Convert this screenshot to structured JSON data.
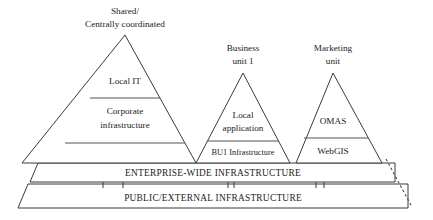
{
  "diagram": {
    "background_color": "#ffffff",
    "line_color": "#3a3a3a",
    "text_color": "#1c1c1c"
  },
  "captions": {
    "shared_line1": "Shared/",
    "shared_line2": "Centrally coordinated",
    "business_line1": "Business",
    "business_line2": "unit 1",
    "marketing_line1": "Marketing",
    "marketing_line2": "unit"
  },
  "pyramids": [
    {
      "id": "shared-pyramid",
      "caption": "Shared/ Centrally coordinated",
      "apex": {
        "x": 125,
        "y": 35
      },
      "base": {
        "left_x": 22,
        "right_x": 196,
        "y": 163
      },
      "tiers": [
        {
          "id": "local-it",
          "label": "Local IT",
          "lines": [
            "Local IT"
          ]
        },
        {
          "id": "corporate-infrastructure",
          "label": "Corporate infrastructure",
          "lines": [
            "Corporate",
            "infrastructure"
          ]
        }
      ],
      "divider_ys": [
        98,
        143
      ]
    },
    {
      "id": "business-unit-pyramid",
      "caption": "Business unit 1",
      "apex": {
        "x": 243,
        "y": 73
      },
      "base": {
        "left_x": 196,
        "right_x": 290,
        "y": 163
      },
      "tiers": [
        {
          "id": "local-application",
          "label": "Local application",
          "lines": [
            "Local",
            "application"
          ]
        },
        {
          "id": "bu1-infrastructure",
          "label": "BU1 Infrastructure",
          "lines": [
            "BU1 Infrastructure"
          ]
        }
      ],
      "divider_ys": [
        141
      ]
    },
    {
      "id": "marketing-unit-pyramid",
      "caption": "Marketing unit",
      "apex": {
        "x": 333,
        "y": 73
      },
      "base": {
        "left_x": 296,
        "right_x": 382,
        "y": 163
      },
      "tiers": [
        {
          "id": "omas",
          "label": "OMAS",
          "lines": [
            "OMAS"
          ]
        },
        {
          "id": "webgis",
          "label": "WebGIS",
          "lines": [
            "WebGIS"
          ]
        }
      ],
      "divider_ys": [
        138
      ]
    }
  ],
  "bands": [
    {
      "id": "enterprise-wide-infrastructure",
      "label": "ENTERPRISE-WIDE INFRASTRUCTURE",
      "top_y": 163,
      "bottom_y": 182,
      "left_top_x": 38,
      "left_bottom_x": 30,
      "right_x": 395
    },
    {
      "id": "public-external-infrastructure",
      "label": "PUBLIC/EXTERNAL INFRASTRUCTURE",
      "top_y": 184,
      "bottom_y": 208,
      "left_top_x": 28,
      "left_bottom_x": 18,
      "right_x": 408
    }
  ],
  "connector_ticks": [
    {
      "id": "tick-shared-left",
      "x": 103
    },
    {
      "id": "tick-shared-right",
      "x": 123
    },
    {
      "id": "tick-bu1-left",
      "x": 228
    },
    {
      "id": "tick-bu1-right",
      "x": 234
    },
    {
      "id": "tick-marketing-left",
      "x": 316
    },
    {
      "id": "tick-marketing-right",
      "x": 324
    }
  ],
  "dashed_edge": {
    "id": "open-ended-right-edge",
    "note": "dashed diagonal indicating diagram continues to the right",
    "from": {
      "x": 385,
      "y": 158
    },
    "to": {
      "x": 413,
      "y": 208
    }
  }
}
